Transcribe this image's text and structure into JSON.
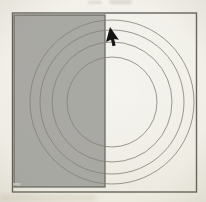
{
  "figure": {
    "description_name": "scanned-diagram-rectangle-over-concentric-circles-with-cursor",
    "background_color": "#f0eee7",
    "frame": {
      "x": 12.5,
      "y": 13,
      "width": 184,
      "height": 179,
      "stroke_color": "#66645c",
      "stroke_width": 1.4
    },
    "circles": {
      "cx": 112,
      "cy": 102,
      "radii": [
        45,
        60,
        72,
        82
      ],
      "stroke_color": "#837f74",
      "stroke_width": 1,
      "stroke_opacity": 0.8
    },
    "overlay_rectangle": {
      "x": 14,
      "y": 15,
      "width": 91,
      "height": 172,
      "fill_color": "#9e9e9a",
      "fill_opacity": 0.88,
      "stroke_color": "#6c6c66",
      "stroke_width": 1.3
    },
    "cursor": {
      "icon": "arrow-pointer-cursor",
      "tip_x": 110,
      "tip_y": 27,
      "rotation_deg": 15,
      "color": "#151515"
    },
    "artifacts": {
      "top_smudge_color": "#b3afa4",
      "rect_inner_mark": {
        "x": 13,
        "y": 183,
        "width": 7.5,
        "height": 2.5,
        "color": "#c7c7c2",
        "opacity": 0.9
      }
    }
  }
}
